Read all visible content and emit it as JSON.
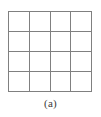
{
  "figure": {
    "caption": "(a)",
    "background_color": "#ffffff",
    "grid": {
      "rows": 4,
      "columns": 4,
      "cell_count": 16,
      "line_color": "#808080",
      "line_width_px": 1,
      "cell_fill": "#ffffff",
      "x_start_px": 8,
      "y_start_px": 11,
      "width_px": 84,
      "height_px": 81,
      "cells": [
        [
          "",
          "",
          "",
          ""
        ],
        [
          "",
          "",
          "",
          ""
        ],
        [
          "",
          "",
          "",
          ""
        ],
        [
          "",
          "",
          "",
          ""
        ]
      ]
    },
    "caption_color": "#3a3a3a"
  }
}
